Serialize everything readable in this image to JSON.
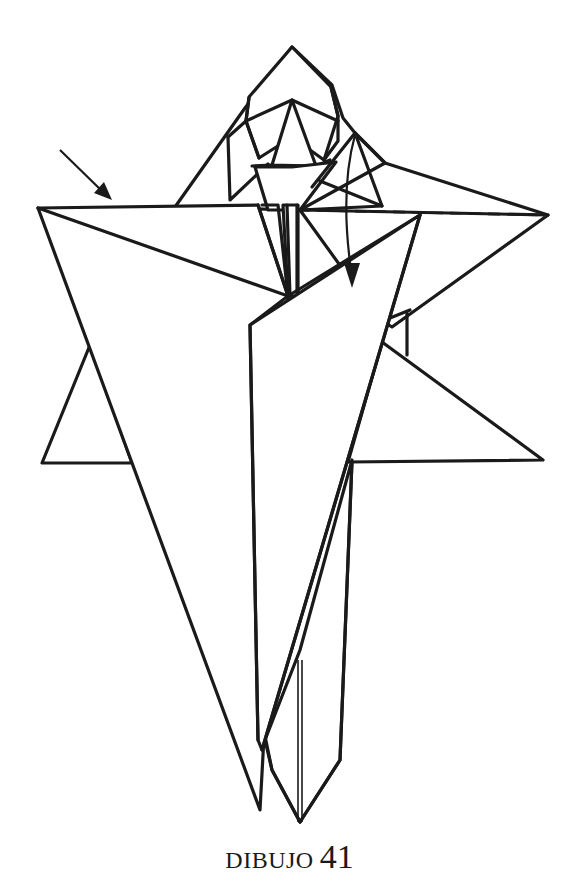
{
  "diagram": {
    "caption_word": "DIBUJO",
    "caption_number": "41",
    "colors": {
      "line": "#1a1a1a",
      "paper": "#ffffff"
    },
    "symbols": [
      {
        "name": "push-arrow",
        "description": "straight arrow pointing to top-left flap edge"
      },
      {
        "name": "fold-down-arrow",
        "description": "curved arrow indicating fold downwards along dashed valley line"
      },
      {
        "name": "valley-fold-line",
        "description": "dashed horizontal line on right flap"
      }
    ]
  }
}
